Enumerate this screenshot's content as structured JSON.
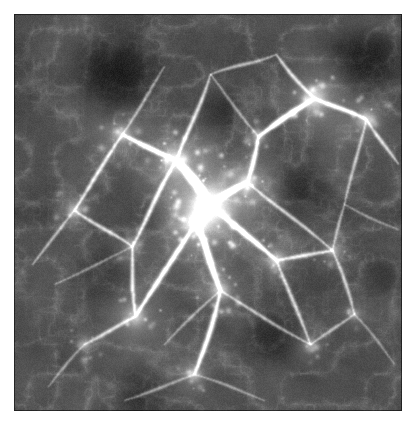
{
  "figure": {
    "kind": "cosmic-web-density-projection",
    "title": "",
    "caption": "",
    "panel": {
      "x": 14,
      "y": 14,
      "width": 388,
      "height": 397
    },
    "canvas": {
      "width": 416,
      "height": 429
    },
    "background_color": "#ffffff",
    "colormap": "grayscale",
    "color_low": "#000000",
    "color_mid": "#4a4a4a",
    "color_high": "#f2f2f2",
    "border_color": "#1a1a1a"
  },
  "chart_data": {
    "type": "heatmap",
    "title": "",
    "xlabel": "",
    "ylabel": "",
    "colormap": "gray",
    "grid": false,
    "legend": "none",
    "xlim": [
      0,
      388
    ],
    "ylim": [
      0,
      397
    ],
    "value_range": [
      0.0,
      1.0
    ],
    "field": {
      "base_level": 0.13,
      "noise_scale": 0.055,
      "fine_grain": 0.05,
      "vignette": 0.1,
      "seed": 20240917
    },
    "nodes": [
      {
        "x": 196,
        "y": 190,
        "r": 30,
        "i": 0.95,
        "label": "central-cluster"
      },
      {
        "x": 182,
        "y": 208,
        "r": 16,
        "i": 0.88,
        "label": "core-knot"
      },
      {
        "x": 162,
        "y": 146,
        "r": 20,
        "i": 0.72,
        "label": "north-west-knot"
      },
      {
        "x": 233,
        "y": 168,
        "r": 14,
        "i": 0.66,
        "label": "north-east-knot"
      },
      {
        "x": 300,
        "y": 84,
        "r": 19,
        "i": 0.7,
        "label": "upper-right-knot"
      },
      {
        "x": 352,
        "y": 105,
        "r": 14,
        "i": 0.58,
        "label": "far-right-knot"
      },
      {
        "x": 108,
        "y": 120,
        "r": 13,
        "i": 0.52,
        "label": "upper-left-knot"
      },
      {
        "x": 60,
        "y": 196,
        "r": 12,
        "i": 0.5,
        "label": "west-knot"
      },
      {
        "x": 121,
        "y": 302,
        "r": 15,
        "i": 0.56,
        "label": "south-west-knot"
      },
      {
        "x": 206,
        "y": 276,
        "r": 14,
        "i": 0.58,
        "label": "south-central-knot"
      },
      {
        "x": 262,
        "y": 246,
        "r": 13,
        "i": 0.54,
        "label": "south-east-knot"
      },
      {
        "x": 318,
        "y": 236,
        "r": 11,
        "i": 0.44,
        "label": "east-knot"
      },
      {
        "x": 180,
        "y": 360,
        "r": 12,
        "i": 0.46,
        "label": "deep-south-knot"
      },
      {
        "x": 296,
        "y": 330,
        "r": 10,
        "i": 0.4,
        "label": "lower-right-knot"
      },
      {
        "x": 70,
        "y": 330,
        "r": 10,
        "i": 0.38,
        "label": "lower-left-knot"
      },
      {
        "x": 244,
        "y": 122,
        "r": 10,
        "i": 0.48,
        "label": "north-bridge-knot"
      },
      {
        "x": 340,
        "y": 300,
        "r": 9,
        "i": 0.36,
        "label": "east-lower-knot"
      },
      {
        "x": 118,
        "y": 232,
        "r": 10,
        "i": 0.42,
        "label": "west-mid-knot"
      }
    ],
    "filaments": [
      {
        "from": [
          196,
          190
        ],
        "to": [
          162,
          146
        ],
        "w": 3.4,
        "i": 0.8
      },
      {
        "from": [
          162,
          146
        ],
        "to": [
          108,
          120
        ],
        "w": 2.4,
        "i": 0.6
      },
      {
        "from": [
          108,
          120
        ],
        "to": [
          60,
          196
        ],
        "w": 2.0,
        "i": 0.48
      },
      {
        "from": [
          196,
          190
        ],
        "to": [
          233,
          168
        ],
        "w": 2.8,
        "i": 0.68
      },
      {
        "from": [
          233,
          168
        ],
        "to": [
          244,
          122
        ],
        "w": 2.2,
        "i": 0.55
      },
      {
        "from": [
          244,
          122
        ],
        "to": [
          300,
          84
        ],
        "w": 2.6,
        "i": 0.64
      },
      {
        "from": [
          300,
          84
        ],
        "to": [
          352,
          105
        ],
        "w": 2.2,
        "i": 0.56
      },
      {
        "from": [
          352,
          105
        ],
        "to": [
          384,
          150
        ],
        "w": 1.8,
        "i": 0.44
      },
      {
        "from": [
          300,
          84
        ],
        "to": [
          262,
          40
        ],
        "w": 1.9,
        "i": 0.46
      },
      {
        "from": [
          196,
          190
        ],
        "to": [
          182,
          208
        ],
        "w": 4.0,
        "i": 0.9
      },
      {
        "from": [
          182,
          208
        ],
        "to": [
          206,
          276
        ],
        "w": 2.8,
        "i": 0.64
      },
      {
        "from": [
          206,
          276
        ],
        "to": [
          180,
          360
        ],
        "w": 2.4,
        "i": 0.52
      },
      {
        "from": [
          182,
          208
        ],
        "to": [
          121,
          302
        ],
        "w": 2.4,
        "i": 0.56
      },
      {
        "from": [
          121,
          302
        ],
        "to": [
          70,
          330
        ],
        "w": 1.9,
        "i": 0.42
      },
      {
        "from": [
          121,
          302
        ],
        "to": [
          118,
          232
        ],
        "w": 2.0,
        "i": 0.46
      },
      {
        "from": [
          118,
          232
        ],
        "to": [
          60,
          196
        ],
        "w": 1.9,
        "i": 0.44
      },
      {
        "from": [
          118,
          232
        ],
        "to": [
          162,
          146
        ],
        "w": 2.1,
        "i": 0.5
      },
      {
        "from": [
          196,
          190
        ],
        "to": [
          262,
          246
        ],
        "w": 2.5,
        "i": 0.58
      },
      {
        "from": [
          262,
          246
        ],
        "to": [
          318,
          236
        ],
        "w": 2.0,
        "i": 0.46
      },
      {
        "from": [
          318,
          236
        ],
        "to": [
          340,
          300
        ],
        "w": 1.8,
        "i": 0.4
      },
      {
        "from": [
          262,
          246
        ],
        "to": [
          296,
          330
        ],
        "w": 1.9,
        "i": 0.42
      },
      {
        "from": [
          296,
          330
        ],
        "to": [
          340,
          300
        ],
        "w": 1.6,
        "i": 0.36
      },
      {
        "from": [
          233,
          168
        ],
        "to": [
          318,
          236
        ],
        "w": 1.8,
        "i": 0.42
      },
      {
        "from": [
          206,
          276
        ],
        "to": [
          296,
          330
        ],
        "w": 1.7,
        "i": 0.38
      },
      {
        "from": [
          60,
          196
        ],
        "to": [
          18,
          250
        ],
        "w": 1.6,
        "i": 0.36
      },
      {
        "from": [
          162,
          146
        ],
        "to": [
          196,
          60
        ],
        "w": 2.0,
        "i": 0.46
      },
      {
        "from": [
          196,
          60
        ],
        "to": [
          262,
          40
        ],
        "w": 1.7,
        "i": 0.38
      },
      {
        "from": [
          108,
          120
        ],
        "to": [
          150,
          52
        ],
        "w": 1.6,
        "i": 0.34
      },
      {
        "from": [
          352,
          105
        ],
        "to": [
          330,
          190
        ],
        "w": 1.7,
        "i": 0.38
      },
      {
        "from": [
          330,
          190
        ],
        "to": [
          318,
          236
        ],
        "w": 1.6,
        "i": 0.36
      },
      {
        "from": [
          180,
          360
        ],
        "to": [
          110,
          386
        ],
        "w": 1.6,
        "i": 0.32
      },
      {
        "from": [
          180,
          360
        ],
        "to": [
          250,
          386
        ],
        "w": 1.5,
        "i": 0.3
      },
      {
        "from": [
          70,
          330
        ],
        "to": [
          34,
          372
        ],
        "w": 1.5,
        "i": 0.3
      },
      {
        "from": [
          340,
          300
        ],
        "to": [
          380,
          350
        ],
        "w": 1.4,
        "i": 0.28
      },
      {
        "from": [
          244,
          122
        ],
        "to": [
          196,
          60
        ],
        "w": 1.5,
        "i": 0.32
      },
      {
        "from": [
          330,
          190
        ],
        "to": [
          384,
          215
        ],
        "w": 1.4,
        "i": 0.28
      },
      {
        "from": [
          118,
          232
        ],
        "to": [
          40,
          270
        ],
        "w": 1.4,
        "i": 0.28
      },
      {
        "from": [
          206,
          276
        ],
        "to": [
          150,
          330
        ],
        "w": 1.5,
        "i": 0.32
      }
    ],
    "voids": [
      {
        "x": 100,
        "y": 58,
        "r": 58,
        "depth": 0.92,
        "label": "upper-left-void"
      },
      {
        "x": 352,
        "y": 48,
        "r": 46,
        "depth": 0.8,
        "label": "upper-right-void"
      },
      {
        "x": 288,
        "y": 176,
        "r": 38,
        "depth": 0.55,
        "label": "mid-right-void"
      },
      {
        "x": 86,
        "y": 262,
        "r": 40,
        "depth": 0.52,
        "label": "mid-left-void"
      },
      {
        "x": 258,
        "y": 324,
        "r": 40,
        "depth": 0.58,
        "label": "lower-right-void"
      },
      {
        "x": 128,
        "y": 374,
        "r": 36,
        "depth": 0.56,
        "label": "lower-left-void"
      },
      {
        "x": 370,
        "y": 262,
        "r": 32,
        "depth": 0.5,
        "label": "east-void"
      },
      {
        "x": 210,
        "y": 96,
        "r": 28,
        "depth": 0.4,
        "label": "north-void"
      }
    ]
  },
  "accessibility": {
    "alt_text": "Grayscale projected density map of a cosmological simulation showing a filamentary cosmic web with a bright central cluster, connecting filaments and dark voids."
  }
}
